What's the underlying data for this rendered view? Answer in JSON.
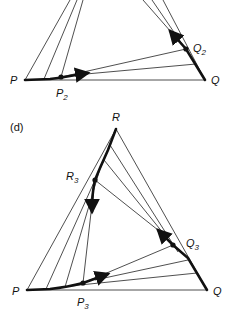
{
  "panels": [
    {
      "id": "c",
      "label": "",
      "vertices": {
        "P": "P",
        "Q": "Q"
      },
      "points": {
        "P2": {
          "base": "P",
          "sub": "2"
        },
        "Q2": {
          "base": "Q",
          "sub": "2"
        }
      }
    },
    {
      "id": "d",
      "label": "(d)",
      "vertices": {
        "P": "P",
        "Q": "Q",
        "R": "R"
      },
      "points": {
        "P3": {
          "base": "P",
          "sub": "3"
        },
        "Q3": {
          "base": "Q",
          "sub": "3"
        },
        "R3": {
          "base": "R",
          "sub": "3"
        }
      }
    }
  ],
  "colors": {
    "ink": "#111111",
    "background": "#ffffff"
  }
}
